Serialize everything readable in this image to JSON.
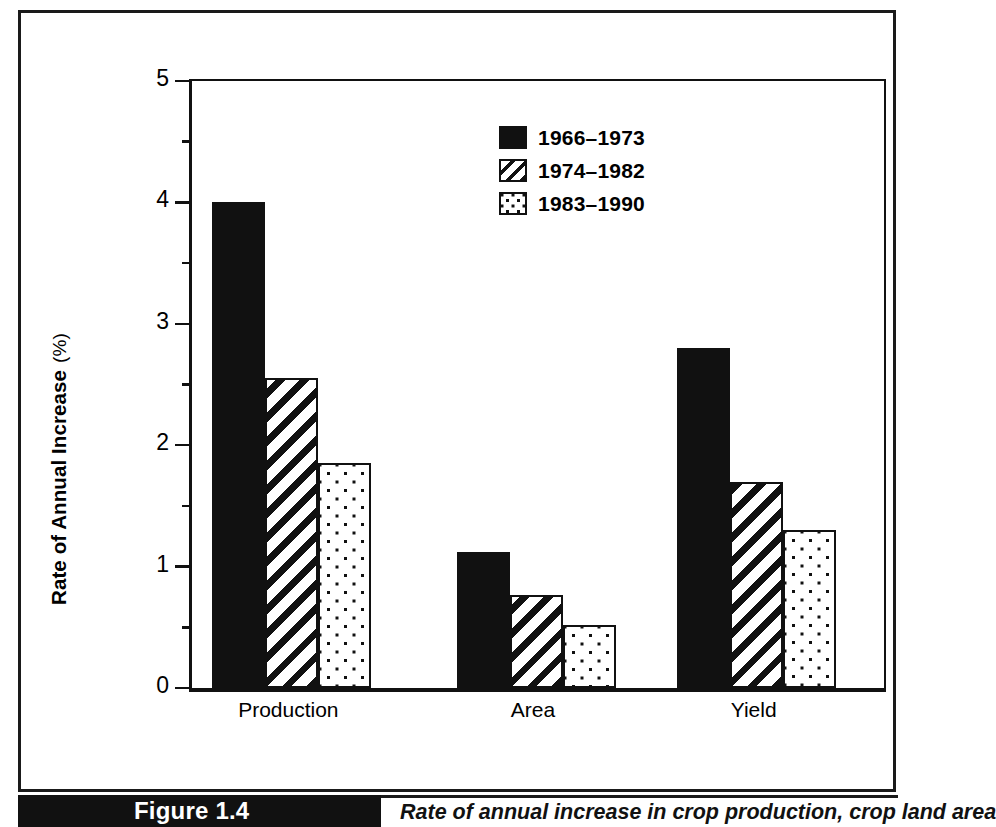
{
  "figure": {
    "number_label": "Figure 1.4",
    "caption": "Rate of annual increase in crop production, crop land area"
  },
  "chart_data": {
    "type": "bar",
    "title": "",
    "xlabel": "",
    "ylabel": "Rate of Annual Increase  (%)",
    "ylabel_main": "Rate of Annual Increase",
    "ylabel_unit": "(%)",
    "ylim": [
      0,
      5
    ],
    "ytick_labels": [
      "0",
      "1",
      "2",
      "3",
      "4",
      "5"
    ],
    "ytick_values": [
      0,
      1,
      2,
      3,
      4,
      5
    ],
    "minor_tick_values": [
      0.5,
      1.5,
      2.5,
      3.5,
      4.5
    ],
    "grid": false,
    "legend_position": "upper center",
    "categories": [
      "Production",
      "Area",
      "Yield"
    ],
    "series": [
      {
        "name": "1966–1973",
        "pattern": "solid",
        "values": [
          4.0,
          1.12,
          2.8
        ]
      },
      {
        "name": "1974–1982",
        "pattern": "diagonal-hatch",
        "values": [
          2.55,
          0.77,
          1.7
        ]
      },
      {
        "name": "1983–1990",
        "pattern": "dots",
        "values": [
          1.85,
          0.52,
          1.3
        ]
      }
    ],
    "colors": {
      "ink": "#111111",
      "background": "#ffffff"
    }
  },
  "legend": {
    "items": [
      {
        "label": "1966–1973",
        "pattern": "solid"
      },
      {
        "label": "1974–1982",
        "pattern": "hatch"
      },
      {
        "label": "1983–1990",
        "pattern": "dots"
      }
    ]
  }
}
